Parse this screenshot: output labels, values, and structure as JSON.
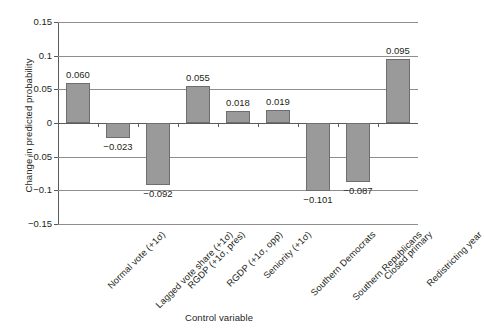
{
  "chart_data": {
    "type": "bar",
    "title": "",
    "xlabel": "Control variable",
    "ylabel": "Change in predicted probability",
    "categories": [
      "Normal vote (+1σ)",
      "Lagged vote share (+1σ)",
      "RGDP (+1σ, pres)",
      "RGDP (+1σ, opp)",
      "Seniority (+1σ)",
      "Southern Democrats",
      "Southern Republicans",
      "Closed primary",
      "Redistricting year"
    ],
    "values": [
      0.06,
      -0.023,
      -0.092,
      0.055,
      0.018,
      0.019,
      -0.101,
      -0.087,
      0.095
    ],
    "value_labels": [
      "0.060",
      "−0.023",
      "−0.092",
      "0.055",
      "0.018",
      "0.019",
      "−0.101",
      "−0.087",
      "0.095"
    ],
    "ylim": [
      -0.15,
      0.15
    ],
    "yticks": [
      0.15,
      0.1,
      0.05,
      0,
      -0.05,
      -0.1,
      -0.15
    ],
    "ytick_labels": [
      "0.15",
      "0.1",
      "0.05",
      "0",
      "−0.05",
      "−0.1",
      "−0.15"
    ],
    "grid": true,
    "legend": "none",
    "bar_color": "#9a9a9a",
    "bar_border_color": "#6e6e6e",
    "axis_color": "#5a5a5a",
    "grid_color": "#8e8e8e",
    "text_color": "#231f20"
  }
}
